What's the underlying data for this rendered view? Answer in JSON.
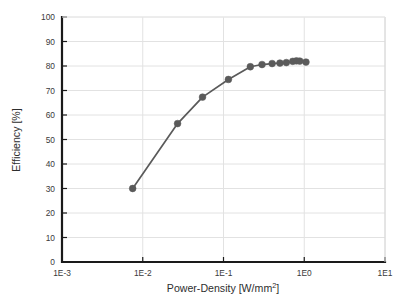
{
  "chart_data": {
    "type": "line",
    "title": "",
    "subtitle": "",
    "xlabel": "Power-Density [W/mm2]",
    "xlabel_base": "Power-Density [W/mm",
    "xlabel_sup": "2",
    "xlabel_tail": "]",
    "ylabel": "Efficiency [%]",
    "xscale": "log",
    "yscale": "linear",
    "xlim": [
      0.001,
      10
    ],
    "ylim": [
      0,
      100
    ],
    "grid": true,
    "legend": null,
    "legend_position": "none",
    "xticks": [
      0.001,
      0.01,
      0.1,
      1,
      10
    ],
    "xtick_labels": [
      "1E-3",
      "1E-2",
      "1E-1",
      "1E0",
      "1E1"
    ],
    "yticks": [
      0,
      10,
      20,
      30,
      40,
      50,
      60,
      70,
      80,
      90,
      100
    ],
    "ytick_labels": [
      "0",
      "10",
      "20",
      "30",
      "40",
      "50",
      "60",
      "70",
      "80",
      "90",
      "100"
    ],
    "series": [
      {
        "name": "Efficiency",
        "color": "#5a5a5a",
        "marker": "circle",
        "marker_size": 3.4,
        "line_width": 1.7,
        "x": [
          0.0075,
          0.027,
          0.055,
          0.115,
          0.215,
          0.3,
          0.4,
          0.5,
          0.6,
          0.72,
          0.8,
          0.88,
          1.05
        ],
        "y": [
          30.0,
          56.5,
          67.3,
          74.5,
          79.7,
          80.6,
          81.0,
          81.2,
          81.4,
          81.9,
          82.1,
          82.0,
          81.6
        ]
      }
    ]
  },
  "axes": {
    "plot_left_px": 62,
    "plot_right_px": 385,
    "plot_top_px": 17,
    "plot_bottom_px": 262,
    "frame_color": "#1a1a1a",
    "grid_color": "#e2e2e2",
    "background": "#ffffff"
  }
}
